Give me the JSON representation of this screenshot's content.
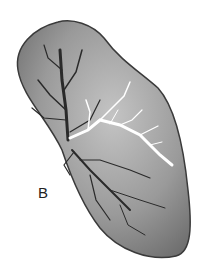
{
  "figure": {
    "panel_label": "B",
    "colors": {
      "organ_fill": "#8a8a8a",
      "organ_light": "#c8c8c8",
      "outline": "#3a3a3a",
      "dark_vessels": "#2a2a2a",
      "white_vessels": "#ffffff"
    }
  }
}
